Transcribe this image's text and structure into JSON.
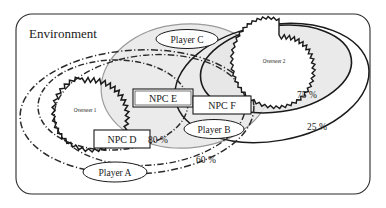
{
  "diagram": {
    "type": "venn-set-diagram",
    "container": {
      "label": "Environment",
      "shape": "rounded-rectangle",
      "stroke": "#2b2b2b",
      "fill": "#ffffff"
    },
    "sets": [
      {
        "id": "player-a-outer",
        "label": "Player A",
        "percent": "60 %",
        "stroke_style": "dash-dot",
        "stroke": "#2b2b2b",
        "fill": "none"
      },
      {
        "id": "player-a-inner",
        "label": "",
        "percent": "80 %",
        "stroke_style": "dash-dot",
        "stroke": "#2b2b2b",
        "fill": "none"
      },
      {
        "id": "player-b",
        "label": "Player B",
        "percent": "",
        "stroke_style": "dash-dot",
        "stroke": "#2b2b2b",
        "fill": "none"
      },
      {
        "id": "player-c",
        "label": "Player C",
        "percent": "",
        "stroke_style": "solid",
        "stroke": "#9a9a9a",
        "fill": "#ebebeb"
      },
      {
        "id": "overseer-2-outer",
        "label": "",
        "percent": "25 %",
        "stroke_style": "solid",
        "stroke": "#1a1a1a",
        "fill": "none"
      },
      {
        "id": "overseer-2-inner",
        "label": "",
        "percent": "75 %",
        "stroke_style": "solid",
        "stroke": "#1a1a1a",
        "fill": "#e6e6e6"
      }
    ],
    "overseers": [
      {
        "id": "overseer-1",
        "label": "Overseer 1",
        "shape": "starburst"
      },
      {
        "id": "overseer-2",
        "label": "Overseer 2",
        "shape": "starburst"
      }
    ],
    "npcs": [
      {
        "id": "npc-d",
        "label": "NPC D",
        "shape": "rectangle"
      },
      {
        "id": "npc-e",
        "label": "NPC E",
        "shape": "rectangle"
      },
      {
        "id": "npc-f",
        "label": "NPC F",
        "shape": "rectangle"
      }
    ],
    "players": [
      {
        "id": "player-a",
        "label": "Player A",
        "shape": "ellipse-badge"
      },
      {
        "id": "player-b",
        "label": "Player B",
        "shape": "ellipse-badge"
      },
      {
        "id": "player-c",
        "label": "Player C",
        "shape": "ellipse-badge"
      }
    ],
    "percent_labels": [
      {
        "id": "pct-75",
        "value": "75 %"
      },
      {
        "id": "pct-25",
        "value": "25 %"
      },
      {
        "id": "pct-80",
        "value": "80 %"
      },
      {
        "id": "pct-60",
        "value": "60 %"
      }
    ],
    "colors": {
      "ink": "#1a1a1a",
      "gray_stroke": "#9a9a9a",
      "gray_fill_light": "#ebebeb",
      "gray_fill": "#e6e6e6",
      "paper": "#ffffff"
    }
  }
}
